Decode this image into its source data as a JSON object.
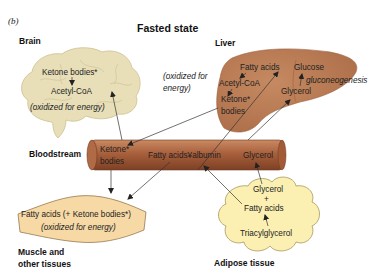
{
  "figure": {
    "panel_label": "(b)",
    "title": "Fasted state"
  },
  "colors": {
    "brain_fill": "#e8dfb8",
    "liver_fill": "#b97b53",
    "bloodstream_fill": "#a8603c",
    "muscle_fill": "#f6d9a5",
    "adipose_fill": "#fbf0b2"
  },
  "brain": {
    "label": "Brain",
    "line1": "Ketone bodies*",
    "line2": "Acetyl-CoA",
    "line3": "(oxidized for energy)"
  },
  "liver": {
    "label": "Liver",
    "fatty_acids": "Fatty acids",
    "acetyl_coa": "Acetyl-CoA",
    "ketone_line1": "Ketone*",
    "ketone_line2": "bodies",
    "glucose": "Glucose",
    "gluconeogenesis": "gluconeogenesis",
    "glycerol": "Glycerol",
    "oxidized_line1": "(oxidized for",
    "oxidized_line2": "energy)"
  },
  "bloodstream": {
    "label": "Bloodstream",
    "ketone_line1": "Ketone*",
    "ketone_line2": "bodies",
    "fatty_acids_albumin": "Fatty acids¥albumin",
    "glycerol": "Glycerol"
  },
  "muscle": {
    "line1": "Fatty acids (+ Ketone bodies*)",
    "line2": "(oxidized for energy)",
    "label_line1": "Muscle and",
    "label_line2": "other tissues"
  },
  "adipose": {
    "glycerol": "Glycerol",
    "plus": "+",
    "fatty_acids": "Fatty acids",
    "triacylglycerol": "Triacylglycerol",
    "label": "Adipose tissue"
  }
}
